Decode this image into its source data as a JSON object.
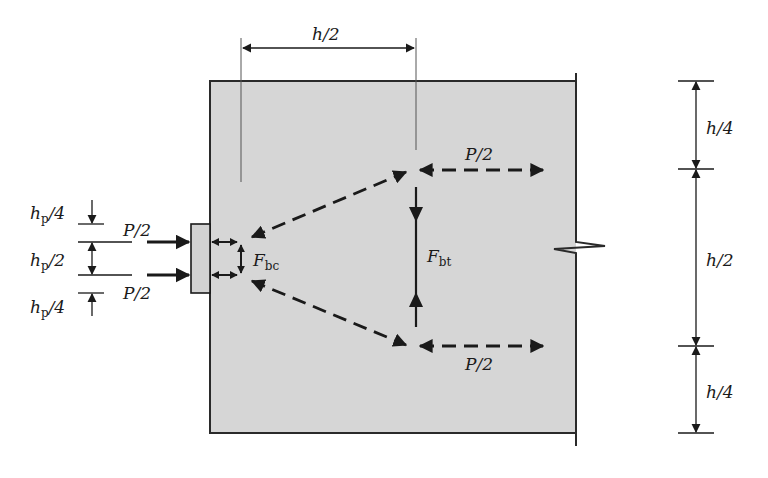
{
  "figure": {
    "type": "strut-and-tie model of anchorage zone",
    "colors": {
      "block_fill": "#d6d6d6",
      "plate_fill": "#d2d2d2",
      "line": "#1a1a1a",
      "background": "#ffffff"
    }
  },
  "labels": {
    "top_dimension": "h/2",
    "right_dim_top": "h/4",
    "right_dim_middle": "h/2",
    "right_dim_bottom": "h/4",
    "left_dim_top": {
      "main": "h",
      "sub": "p",
      "rest": "/4"
    },
    "left_dim_middle": {
      "main": "h",
      "sub": "p",
      "rest": "/2"
    },
    "left_dim_bottom": {
      "main": "h",
      "sub": "p",
      "rest": "/4"
    },
    "load_upper": "P/2",
    "load_lower": "P/2",
    "tie_upper": "P/2",
    "tie_lower": "P/2",
    "bursting_compression": {
      "main": "F",
      "sub": "bc"
    },
    "bursting_tension": {
      "main": "F",
      "sub": "bt"
    }
  }
}
